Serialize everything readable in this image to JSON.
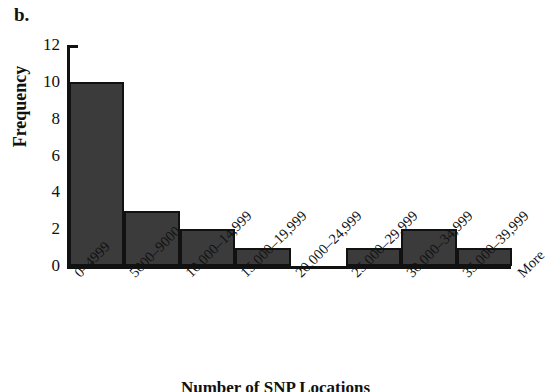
{
  "panel": {
    "letter": "b."
  },
  "caption": {
    "text": "Number of SNP Locations"
  },
  "axis": {
    "y_title": "Frequency",
    "y_ticks": [
      "12",
      "10",
      "8",
      "6",
      "4",
      "2",
      "0"
    ],
    "x_more_label": "More"
  },
  "colors": {
    "bar_fill": "#3b3b3b",
    "bar_stroke": "#111111",
    "axis": "#111111",
    "background": "#ffffff",
    "text": "#111111"
  },
  "chart_data": {
    "type": "bar",
    "title": "",
    "subtitle": "",
    "xlabel": "Number of SNP Locations",
    "ylabel": "Frequency",
    "ylim": [
      0,
      12
    ],
    "ytick_values": [
      0,
      2,
      4,
      6,
      8,
      10,
      12
    ],
    "grid": false,
    "legend": false,
    "categories": [
      "0–4999",
      "5000–9000",
      "10,000–14,999",
      "15,000–19,999",
      "20,000–24,999",
      "25,000–29,999",
      "30,000–34,999",
      "35,000–39,999",
      "More"
    ],
    "values": [
      10,
      3,
      2,
      1,
      0,
      1,
      2,
      1,
      0
    ]
  }
}
